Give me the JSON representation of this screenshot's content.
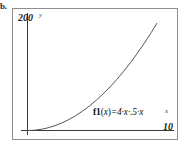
{
  "figure": {
    "item_label": "b.",
    "frame_color": "#8d8d8d",
    "background": "#ffffff"
  },
  "axes": {
    "y_max_label": "200",
    "y_axis_name": "y",
    "x_max_label": "10",
    "x_axis_name": "x",
    "axis_color": "#3a3a3a"
  },
  "annotation": {
    "function_label": "f1(x)=4·x·.5·x",
    "fn_name": "f1",
    "fn_open": "(",
    "fn_var": "x",
    "fn_close": ")",
    "fn_body": "=4·x·.5·x"
  },
  "chart_data": {
    "type": "line",
    "title": "",
    "subtitle": "",
    "xlabel": "x",
    "ylabel": "y",
    "xlim": [
      0,
      10
    ],
    "ylim": [
      0,
      200
    ],
    "grid": false,
    "legend": null,
    "curve_color": "#555555",
    "annotations": [
      {
        "text": "f1(x)=4·x·.5·x",
        "x": 5.2,
        "y": 22
      }
    ],
    "series": [
      {
        "name": "f1(x)=4·x·.5·x",
        "x": [
          0,
          0.5,
          1,
          1.5,
          2,
          2.5,
          3,
          3.5,
          4,
          4.5,
          5,
          5.5,
          6,
          6.5,
          7,
          7.5,
          8,
          8.5,
          9,
          9.4
        ],
        "values": [
          0,
          0.5,
          2,
          4.5,
          8,
          12.5,
          18,
          24.5,
          32,
          40.5,
          50,
          60.5,
          72,
          84.5,
          98,
          112.5,
          128,
          144.5,
          162,
          177
        ]
      }
    ]
  }
}
